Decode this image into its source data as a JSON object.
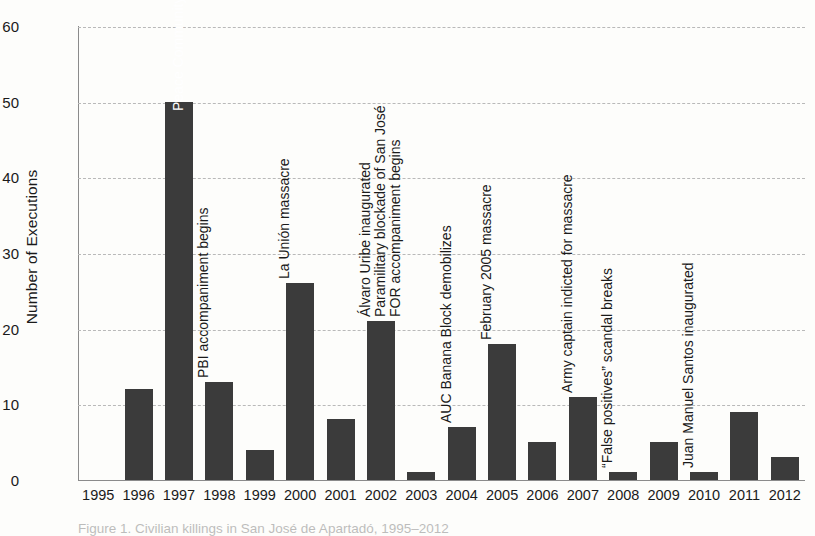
{
  "chart_data": {
    "type": "bar",
    "title": "",
    "xlabel": "",
    "ylabel": "Number of Executions",
    "ylim": [
      0,
      60
    ],
    "ytick_step": 10,
    "yticks": [
      0,
      10,
      20,
      30,
      40,
      50,
      60
    ],
    "grid": true,
    "legend": "none",
    "bar_color": "#3b3b3b",
    "grid_color": "#b9b9b9",
    "axis_color": "#8b8b8b",
    "categories": [
      "1995",
      "1996",
      "1997",
      "1998",
      "1999",
      "2000",
      "2001",
      "2002",
      "2003",
      "2004",
      "2005",
      "2006",
      "2007",
      "2008",
      "2009",
      "2010",
      "2011",
      "2012"
    ],
    "values": [
      0,
      12,
      50,
      13,
      4,
      26,
      8,
      21,
      1,
      7,
      18,
      5,
      11,
      1,
      5,
      1,
      9,
      3
    ],
    "annotations": [
      {
        "category": "1997",
        "text": "Peace Community declaration",
        "placement": "inside-bar"
      },
      {
        "category": "1998",
        "text": "PBI accompaniment begins",
        "placement": "above-bar"
      },
      {
        "category": "2000",
        "text": "La Unión massacre",
        "placement": "above-bar"
      },
      {
        "category": "2002",
        "text": "Álvaro Uribe inaugurated",
        "placement": "above-bar"
      },
      {
        "category": "2002",
        "text": "Paramilitary blockade of San José",
        "placement": "above-bar"
      },
      {
        "category": "2002",
        "text": "FOR accompaniment begins",
        "placement": "above-bar"
      },
      {
        "category": "2004",
        "text": "AUC Banana Block demobilizes",
        "placement": "above-bar"
      },
      {
        "category": "2005",
        "text": "February 2005 massacre",
        "placement": "above-bar"
      },
      {
        "category": "2007",
        "text": "Army captain indicted for massacre",
        "placement": "above-bar"
      },
      {
        "category": "2008",
        "text": "“False positives” scandal breaks",
        "placement": "above-bar"
      },
      {
        "category": "2010",
        "text": "Juan Manuel Santos inaugurated",
        "placement": "above-bar"
      }
    ]
  },
  "caption": {
    "text": "Figure 1. Civilian killings in San José de Apartadó, 1995–2012"
  }
}
